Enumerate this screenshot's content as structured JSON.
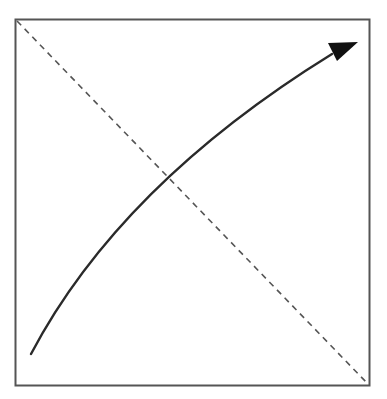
{
  "diagram": {
    "colors": {
      "background": "#ffffff",
      "frame": "#555555",
      "dashed_line": "#555555",
      "arrow": "#2a2a2a",
      "arrowhead": "#111111"
    },
    "elements": [
      {
        "name": "frame",
        "type": "rectangle",
        "shape": "square"
      },
      {
        "name": "diagonal",
        "type": "dashed-line",
        "from": "top-left",
        "to": "bottom-right"
      },
      {
        "name": "curve-arrow",
        "type": "curved-arrow",
        "from": "bottom-left",
        "to": "top-right",
        "curvature": "concave"
      }
    ]
  }
}
